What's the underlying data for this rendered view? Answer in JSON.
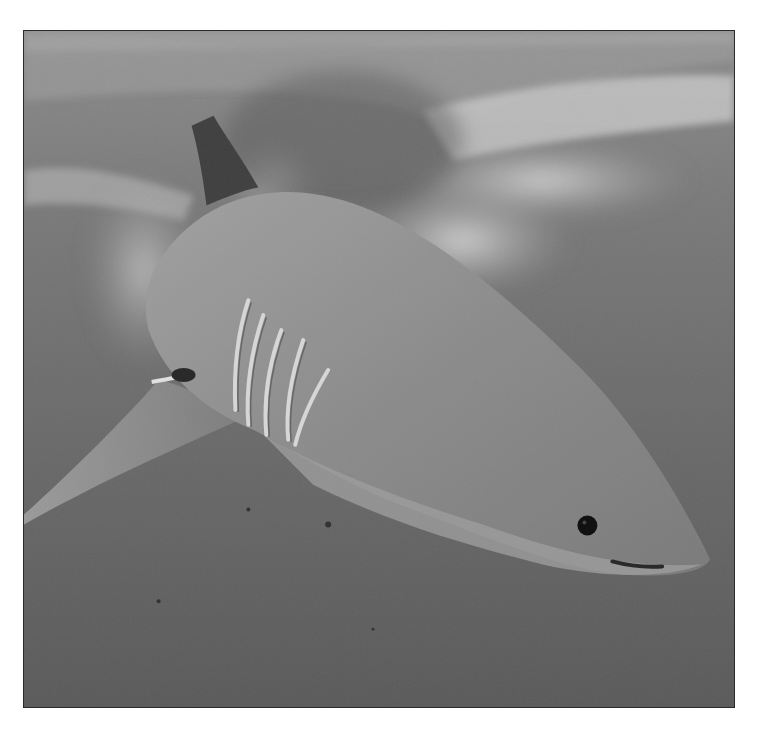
{
  "image": {
    "subject": "Great white shark swimming underwater near the surface",
    "style": "grayscale photograph",
    "colors": {
      "border": "#2a2a2a",
      "water_deep": "#5e5e5e",
      "water_mid": "#787878",
      "surface_light": "#bdbdbd",
      "shark_body": "#8a8a8a",
      "shark_belly": "#9a9a9a",
      "eye": "#111111",
      "background": "#ffffff"
    }
  }
}
